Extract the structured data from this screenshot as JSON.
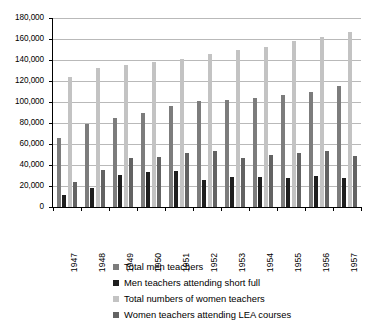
{
  "chart_data": {
    "type": "bar",
    "title": "",
    "subtitle": "",
    "xlabel": "",
    "ylabel": "",
    "ylim": [
      0,
      180000
    ],
    "ytick_step": 20000,
    "grid": true,
    "legend_position": "bottom",
    "categories": [
      "1947",
      "1948",
      "1949",
      "1950",
      "1951",
      "1952",
      "1953",
      "1954",
      "1955",
      "1956",
      "1957"
    ],
    "ytick_labels": [
      "0",
      "20,000",
      "40,000",
      "60,000",
      "80,000",
      "100,000",
      "120,000",
      "140,000",
      "160,000",
      "180,000"
    ],
    "ytick_values": [
      0,
      20000,
      40000,
      60000,
      80000,
      100000,
      120000,
      140000,
      160000,
      180000
    ],
    "series": [
      {
        "name": "Total men teachers",
        "color": "#7c7c7c",
        "values": [
          66000,
          79000,
          85000,
          90000,
          96000,
          101000,
          102000,
          104000,
          107000,
          110000,
          115000
        ]
      },
      {
        "name": "Men teachers attending short full",
        "color": "#1f1f1f",
        "values": [
          11500,
          18500,
          30500,
          33500,
          34000,
          26000,
          28500,
          29000,
          28000,
          29500,
          28000
        ]
      },
      {
        "name": "Total numbers of women teachers",
        "color": "#c3c3c3",
        "values": [
          124000,
          132000,
          135000,
          138000,
          141000,
          146000,
          150000,
          152000,
          158000,
          162000,
          167000
        ]
      },
      {
        "name": "Women teachers attending LEA courses",
        "color": "#636363",
        "values": [
          24000,
          35500,
          46500,
          47500,
          51500,
          53000,
          47000,
          50000,
          51000,
          53000,
          49000
        ]
      }
    ]
  },
  "legend": {
    "items": [
      {
        "label": "Total men teachers",
        "swatch": "legend-swatch-total-men-teachers"
      },
      {
        "label": "Men teachers attending short full",
        "swatch": "legend-swatch-men-short-full"
      },
      {
        "label": "Total numbers of women teachers",
        "swatch": "legend-swatch-total-women-teachers"
      },
      {
        "label": "Women teachers attending LEA courses",
        "swatch": "legend-swatch-women-lea-courses"
      }
    ]
  }
}
